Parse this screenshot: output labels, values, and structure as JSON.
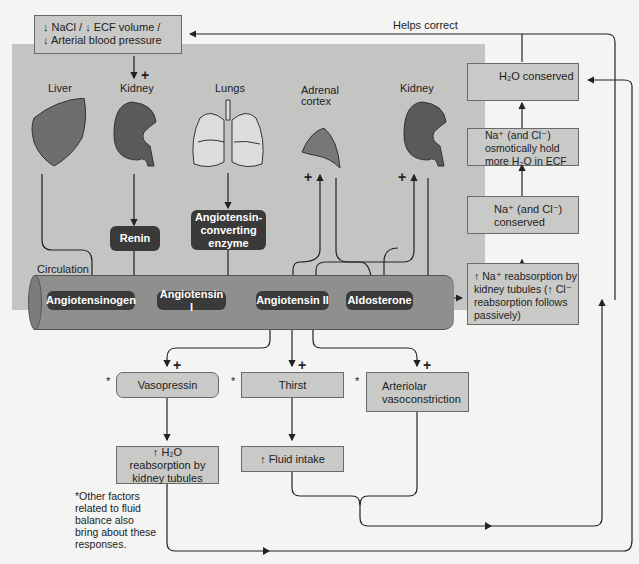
{
  "top_box": {
    "line1": "↓ NaCl / ↓ ECF volume /",
    "line2": "↓ Arterial blood pressure"
  },
  "feedback_label": "Helps correct",
  "organs": {
    "liver": "Liver",
    "kidney_left": "Kidney",
    "lungs": "Lungs",
    "adrenal": "Adrenal cortex",
    "kidney_right": "Kidney"
  },
  "enzymes": {
    "renin": "Renin",
    "ace": "Angiotensin-converting enzyme"
  },
  "circulation": {
    "label": "Circulation",
    "items": [
      "Angiotensinogen",
      "Angiotensin I",
      "Angiotensin II",
      "Aldosterone"
    ]
  },
  "right_column": [
    "H₂O conserved",
    "Na⁺ (and Cl⁻) osmotically hold more H₂O in ECF",
    "Na⁺ (and Cl⁻) conserved",
    "↑ Na⁺ reabsorption by kidney tubules (↑ Cl⁻ reabsorption follows passively)"
  ],
  "responses": {
    "vasopressin": "Vasopressin",
    "thirst": "Thirst",
    "vasoconstriction": "Arteriolar vasoconstriction",
    "h2o_reabsorption": "↑ H₂O reabsorption by kidney tubules",
    "fluid_intake": "↑ Fluid intake"
  },
  "markers": {
    "plus": "+",
    "star": "*"
  },
  "footnote": "*Other factors related to fluid balance also bring about these responses.",
  "colors": {
    "panel": "#c4c4c2",
    "box": "#c9c9c7",
    "dark": "#3a3a3a",
    "tube": "#8f8f8d",
    "organ": "#6e6e6c",
    "background": "#f4f4f2"
  }
}
